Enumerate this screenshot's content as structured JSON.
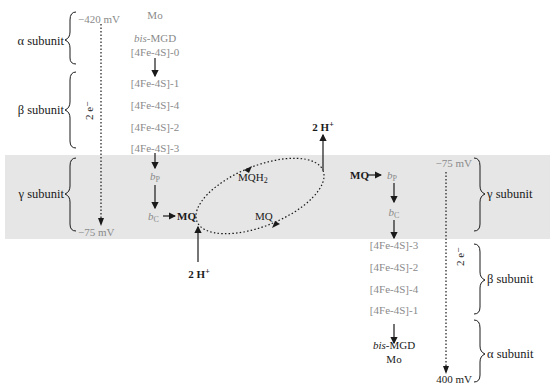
{
  "diagram": {
    "type": "redox-loop",
    "colors": {
      "membrane": "#e6e6e6",
      "cofactor_text": "#8a8a8a",
      "label_text": "#1a1a1a"
    },
    "left_complex": {
      "subunits": [
        {
          "label": "α subunit"
        },
        {
          "label": "β subunit"
        },
        {
          "label": "γ subunit"
        }
      ],
      "potential_top": "−420 mV",
      "potential_bottom": "−75 mV",
      "electron_label": "2 e⁻",
      "chain": [
        "Mo",
        "bis-MGD",
        "[4Fe-4S]-0",
        "[4Fe-4S]-1",
        "[4Fe-4S]-4",
        "[4Fe-4S]-2",
        "[4Fe-4S]-3",
        "bP",
        "bC"
      ],
      "chain_display": {
        "mo": "Mo",
        "bis_italic": "bis",
        "mgd": "-MGD",
        "fes0": "[4Fe-4S]-0",
        "fes1": "[4Fe-4S]-1",
        "fes4": "[4Fe-4S]-4",
        "fes2": "[4Fe-4S]-2",
        "fes3": "[4Fe-4S]-3",
        "b": "b",
        "p_sub": "P",
        "c_sub": "C"
      },
      "quinone": "MQ",
      "protons": "2 H",
      "proton_sup": "+"
    },
    "quinone_pool": {
      "reduced": "MQH",
      "reduced_sub": "2",
      "oxidized": "MQ"
    },
    "right_complex": {
      "subunits": [
        {
          "label": "γ subunit"
        },
        {
          "label": "β subunit"
        },
        {
          "label": "α subunit"
        }
      ],
      "potential_top": "−75 mV",
      "potential_bottom": "400 mV",
      "electron_label": "2 e⁻",
      "quinone": "MQ",
      "protons": "2 H",
      "proton_sup": "+",
      "chain_display": {
        "b": "b",
        "p_sub": "P",
        "c_sub": "C",
        "fes3": "[4Fe-4S]-3",
        "fes2": "[4Fe-4S]-2",
        "fes4": "[4Fe-4S]-4",
        "fes1": "[4Fe-4S]-1",
        "bis_italic": "bis",
        "mgd": "-MGD",
        "mo": "Mo"
      }
    }
  }
}
